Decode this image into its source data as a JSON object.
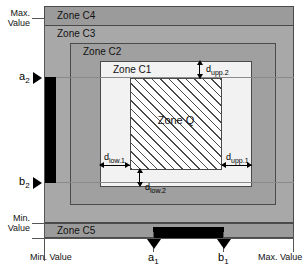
{
  "diagram": {
    "zones": {
      "c4": "Zone C4",
      "c3": "Zone C3",
      "c2": "Zone C2",
      "c1": "Zone C1",
      "c5": "Zone C5",
      "q": "Zone Q"
    },
    "axes": {
      "vertical_max": "Max.\nValue",
      "vertical_max_line1": "Max.",
      "vertical_max_line2": "Value",
      "vertical_min_line1": "Min.",
      "vertical_min_line2": "Value",
      "horizontal_min": "Min. Value",
      "horizontal_max": "Max. Value"
    },
    "markers": {
      "a1": "a",
      "a1_sub": "1",
      "b1": "b",
      "b1_sub": "1",
      "a2": "a",
      "a2_sub": "2",
      "b2": "b",
      "b2_sub": "2"
    },
    "dimensions": {
      "d_upp_1": "d",
      "d_upp_1_sub": "upp.1",
      "d_upp_2": "d",
      "d_upp_2_sub": "upp.2",
      "d_low_1": "d",
      "d_low_1_sub": "low.1",
      "d_low_2": "d",
      "d_low_2_sub": "low.2"
    },
    "colors": {
      "zone_c4": "#9b9b9b",
      "zone_c3": "#a8a8a8",
      "zone_c2": "#a0a0a0",
      "zone_c1": "#f2f2f2",
      "zone_c5": "#9b9b9b",
      "zone_q_hatch": "#4a4a4a",
      "interval_bar": "#000000",
      "border": "#4a4a4a"
    }
  }
}
